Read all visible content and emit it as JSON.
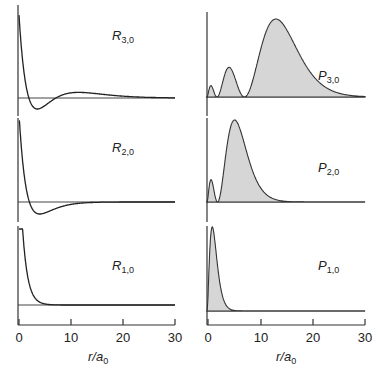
{
  "chart_data": [
    {
      "type": "line",
      "title": "",
      "panel": "left-top",
      "label": "R3,0",
      "label_main": "R",
      "label_sub": "3,0",
      "function": "radial wavefunction R(n=3,l=0)",
      "n": 3,
      "xlabel": "r/a0",
      "xlim": [
        0,
        30
      ],
      "xticks": [
        0,
        10,
        20,
        30
      ],
      "features": {
        "nodes": [
          1.9,
          7.1
        ],
        "min_near": 4.0,
        "local_max_near": 11.0
      }
    },
    {
      "type": "line",
      "title": "",
      "panel": "left-middle",
      "label": "R2,0",
      "label_main": "R",
      "label_sub": "2,0",
      "function": "radial wavefunction R(n=2,l=0)",
      "n": 2,
      "xlabel": "r/a0",
      "xlim": [
        0,
        30
      ],
      "xticks": [
        0,
        10,
        20,
        30
      ],
      "features": {
        "nodes": [
          2.0
        ],
        "min_near": 4.0
      }
    },
    {
      "type": "line",
      "title": "",
      "panel": "left-bottom",
      "label": "R1,0",
      "label_main": "R",
      "label_sub": "1,0",
      "function": "radial wavefunction R(n=1,l=0)",
      "n": 1,
      "xlabel": "r/a0",
      "xlim": [
        0,
        30
      ],
      "xticks": [
        0,
        10,
        20,
        30
      ],
      "features": {
        "decays_to_zero_by": 5
      }
    },
    {
      "type": "area",
      "title": "",
      "panel": "right-top",
      "label": "P3,0",
      "label_main": "P",
      "label_sub": "3,0",
      "function": "radial probability density P(n=3,l=0)",
      "n": 3,
      "xlabel": "r/a0",
      "xlim": [
        0,
        30
      ],
      "xticks": [
        0,
        10,
        20,
        30
      ],
      "features": {
        "peaks_near": [
          0.7,
          4.2,
          13.1
        ],
        "zeros": [
          1.9,
          7.1
        ]
      }
    },
    {
      "type": "area",
      "title": "",
      "panel": "right-middle",
      "label": "P2,0",
      "label_main": "P",
      "label_sub": "2,0",
      "function": "radial probability density P(n=2,l=0)",
      "n": 2,
      "xlabel": "r/a0",
      "xlim": [
        0,
        30
      ],
      "xticks": [
        0,
        10,
        20,
        30
      ],
      "features": {
        "peaks_near": [
          0.8,
          5.2
        ],
        "zeros": [
          2.0
        ]
      }
    },
    {
      "type": "area",
      "title": "",
      "panel": "right-bottom",
      "label": "P1,0",
      "label_main": "P",
      "label_sub": "1,0",
      "function": "radial probability density P(n=1,l=0)",
      "n": 1,
      "xlabel": "r/a0",
      "xlim": [
        0,
        30
      ],
      "xticks": [
        0,
        10,
        20,
        30
      ],
      "features": {
        "peaks_near": [
          1.0
        ]
      }
    }
  ],
  "axes": {
    "xlabel_main": "r/a",
    "xlabel_sub": "0",
    "tick_labels": [
      "0",
      "10",
      "20",
      "30"
    ]
  },
  "colors": {
    "fill": "#d6d6d6",
    "line": "#222222"
  }
}
